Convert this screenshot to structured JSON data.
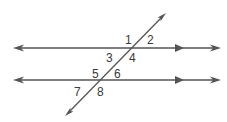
{
  "diagram": {
    "colors": {
      "line": "#555555",
      "text": "#3a3a3a",
      "background": "#ffffff"
    },
    "parallel_lines": [
      {
        "id": "top",
        "y": 48,
        "parallel_marker": "single-arrow"
      },
      {
        "id": "bottom",
        "y": 80,
        "parallel_marker": "single-arrow"
      }
    ],
    "transversal": {
      "from": [
        66,
        115
      ],
      "to": [
        165,
        14
      ]
    },
    "angle_labels": [
      {
        "text": "1",
        "x": 125,
        "y": 44
      },
      {
        "text": "2",
        "x": 147,
        "y": 44
      },
      {
        "text": "3",
        "x": 106,
        "y": 62
      },
      {
        "text": "4",
        "x": 129,
        "y": 62
      },
      {
        "text": "5",
        "x": 92,
        "y": 78
      },
      {
        "text": "6",
        "x": 114,
        "y": 78
      },
      {
        "text": "7",
        "x": 74,
        "y": 96
      },
      {
        "text": "8",
        "x": 97,
        "y": 96
      }
    ]
  }
}
